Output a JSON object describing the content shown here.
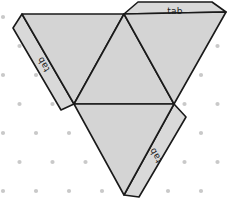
{
  "figure": {
    "background_color": "#ffffff",
    "face_fill_color": "#d4d4d4",
    "tab_fill_color": "#d9d9d9",
    "stroke_color": "#1a1a1a",
    "dot_color": "#c9c9c9",
    "stroke_width": 1.6,
    "canvas": {
      "width": 229,
      "height": 207
    }
  },
  "dot_grid": {
    "name": "isometric-dot-grid",
    "dot_radius": 2.1,
    "column_spacing": 33,
    "row_spacing": 29,
    "row_offset": 16.5,
    "origin_x": 3,
    "origin_y": 17
  },
  "net": {
    "type": "tetrahedron-net",
    "vertices": {
      "top_left": [
        22,
        14
      ],
      "top_mid": [
        124,
        14
      ],
      "mid_left": [
        74,
        104
      ],
      "mid_right": [
        174,
        104
      ],
      "bottom_tip": [
        124,
        195
      ],
      "top_right_outer": [
        226,
        12
      ]
    },
    "faces": [
      {
        "name": "upper-left-face",
        "points": "22,14 124,14 74,104"
      },
      {
        "name": "upper-center-face",
        "points": "124,14 174,104 74,104"
      },
      {
        "name": "upper-right-face",
        "points": "124,14 226,12 174,104"
      },
      {
        "name": "lower-center-face",
        "points": "74,104 174,104 124,195"
      }
    ],
    "tabs": [
      {
        "name": "tab-top",
        "label": "tab",
        "points": "124,14 138,2 212,2 226,12",
        "label_x": 175,
        "label_y": 11,
        "rotation": 0
      },
      {
        "name": "tab-left",
        "label": "tab",
        "points": "22,14 74,104 61,110 13,28",
        "label_x": 44,
        "label_y": 64,
        "rotation": 240
      },
      {
        "name": "tab-bottom-right",
        "label": "tab",
        "points": "174,104 124,195 139,197 186,117",
        "label_x": 156,
        "label_y": 155,
        "rotation": 240
      }
    ]
  }
}
